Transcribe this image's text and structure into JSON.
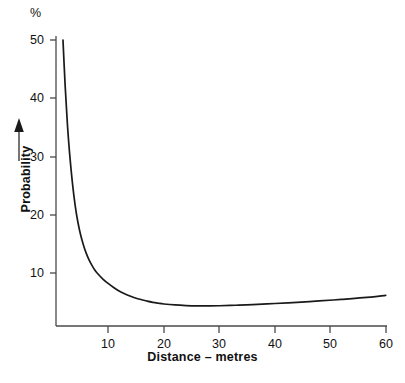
{
  "chart_data": {
    "type": "line",
    "title": "",
    "subtitle": "",
    "xlabel": "Distance – metres",
    "ylabel": "Probability",
    "unit_label": "%",
    "xlim": [
      0,
      60
    ],
    "ylim": [
      0,
      50
    ],
    "grid": false,
    "legend": null,
    "x_ticks": [
      10,
      20,
      30,
      40,
      50,
      60
    ],
    "x_tick_labels": [
      "10",
      "20",
      "30",
      "40",
      "50",
      "60"
    ],
    "y_ticks": [
      10,
      20,
      30,
      40,
      50
    ],
    "y_tick_labels": [
      "10",
      "20",
      "30",
      "40",
      "50"
    ],
    "series": [
      {
        "name": "Probability",
        "color": "#1a1a1a",
        "x": [
          1.8,
          2.2,
          2.6,
          3.0,
          3.5,
          4.0,
          4.5,
          5.0,
          5.5,
          6.0,
          6.5,
          7.0,
          7.5,
          8.0,
          9.0,
          10.0,
          11.0,
          12.0,
          13.0,
          14.0,
          15.0,
          16.0,
          17.0,
          18.0,
          19.0,
          20.0,
          22.0,
          24.0,
          26.0,
          28.0,
          30.0,
          33.0,
          36.0,
          40.0,
          44.0,
          48.0,
          52.0,
          56.0,
          60.0
        ],
        "y": [
          50.0,
          42.0,
          35.5,
          30.5,
          25.5,
          21.6,
          18.7,
          16.5,
          14.8,
          13.4,
          12.3,
          11.4,
          10.6,
          10.0,
          9.0,
          8.2,
          7.5,
          6.9,
          6.45,
          6.05,
          5.7,
          5.45,
          5.2,
          5.0,
          4.85,
          4.72,
          4.55,
          4.45,
          4.4,
          4.4,
          4.42,
          4.5,
          4.6,
          4.8,
          5.0,
          5.25,
          5.5,
          5.8,
          6.2
        ]
      }
    ],
    "annotations": [
      {
        "name": "y-axis-arrow",
        "description": "upward arrow beside rotated Probability label"
      }
    ]
  },
  "axis_labels": {
    "x_title": "Distance – metres",
    "y_title": "Probability",
    "percent": "%"
  },
  "ticks": {
    "x": [
      "10",
      "20",
      "30",
      "40",
      "50",
      "60"
    ],
    "y": [
      "50",
      "40",
      "30",
      "20",
      "10"
    ]
  },
  "colors": {
    "curve": "#1a1a1a",
    "axis": "#4a4a4a",
    "text": "#111111",
    "background": "#ffffff"
  }
}
